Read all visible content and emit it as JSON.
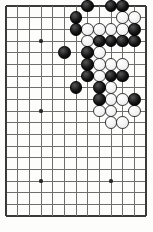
{
  "board": {
    "title": "Go board position",
    "board_size": 19,
    "visible_columns": 13,
    "visible_rows": 19,
    "geometry": {
      "origin_x": 6,
      "origin_y": 6,
      "spacing": 11.67,
      "stone_diameter": 12.6,
      "star_radius": 1.6
    },
    "colors": {
      "background": "#fdfdfb",
      "line": "#6e6e6e",
      "edge_line": "#3a3a3a",
      "black_stone": "#141414",
      "white_stone": "#f6f6f6",
      "white_stone_outline": "#3a3a3a",
      "star_point": "#2b2b2b"
    },
    "star_points": [
      {
        "col": 3,
        "row": 3
      },
      {
        "col": 3,
        "row": 9
      },
      {
        "col": 3,
        "row": 15
      },
      {
        "col": 9,
        "row": 15
      }
    ],
    "stones": [
      {
        "color": "black",
        "col": 7,
        "row": 0
      },
      {
        "color": "black",
        "col": 9,
        "row": 0
      },
      {
        "color": "black",
        "col": 10,
        "row": 0
      },
      {
        "color": "black",
        "col": 6,
        "row": 1
      },
      {
        "color": "white",
        "col": 10,
        "row": 1
      },
      {
        "color": "white",
        "col": 11,
        "row": 1
      },
      {
        "color": "black",
        "col": 6,
        "row": 2
      },
      {
        "color": "white",
        "col": 7,
        "row": 2
      },
      {
        "color": "white",
        "col": 8,
        "row": 2
      },
      {
        "color": "white",
        "col": 9,
        "row": 2
      },
      {
        "color": "white",
        "col": 10,
        "row": 2
      },
      {
        "color": "black",
        "col": 11,
        "row": 2
      },
      {
        "color": "white",
        "col": 7,
        "row": 3
      },
      {
        "color": "black",
        "col": 8,
        "row": 3
      },
      {
        "color": "black",
        "col": 9,
        "row": 3
      },
      {
        "color": "black",
        "col": 10,
        "row": 3
      },
      {
        "color": "black",
        "col": 11,
        "row": 3
      },
      {
        "color": "black",
        "col": 5,
        "row": 4
      },
      {
        "color": "black",
        "col": 7,
        "row": 4
      },
      {
        "color": "white",
        "col": 8,
        "row": 4
      },
      {
        "color": "black",
        "col": 7,
        "row": 5
      },
      {
        "color": "white",
        "col": 8,
        "row": 5
      },
      {
        "color": "white",
        "col": 9,
        "row": 5
      },
      {
        "color": "white",
        "col": 10,
        "row": 5
      },
      {
        "color": "black",
        "col": 7,
        "row": 6
      },
      {
        "color": "white",
        "col": 8,
        "row": 6
      },
      {
        "color": "black",
        "col": 9,
        "row": 6
      },
      {
        "color": "black",
        "col": 10,
        "row": 6
      },
      {
        "color": "black",
        "col": 6,
        "row": 7
      },
      {
        "color": "black",
        "col": 8,
        "row": 7
      },
      {
        "color": "white",
        "col": 9,
        "row": 7
      },
      {
        "color": "black",
        "col": 8,
        "row": 8
      },
      {
        "color": "white",
        "col": 9,
        "row": 8
      },
      {
        "color": "white",
        "col": 10,
        "row": 8
      },
      {
        "color": "black",
        "col": 11,
        "row": 8
      },
      {
        "color": "white",
        "col": 8,
        "row": 9
      },
      {
        "color": "white",
        "col": 9,
        "row": 9
      },
      {
        "color": "white",
        "col": 11,
        "row": 9
      },
      {
        "color": "white",
        "col": 9,
        "row": 10
      },
      {
        "color": "white",
        "col": 10,
        "row": 10
      }
    ]
  }
}
